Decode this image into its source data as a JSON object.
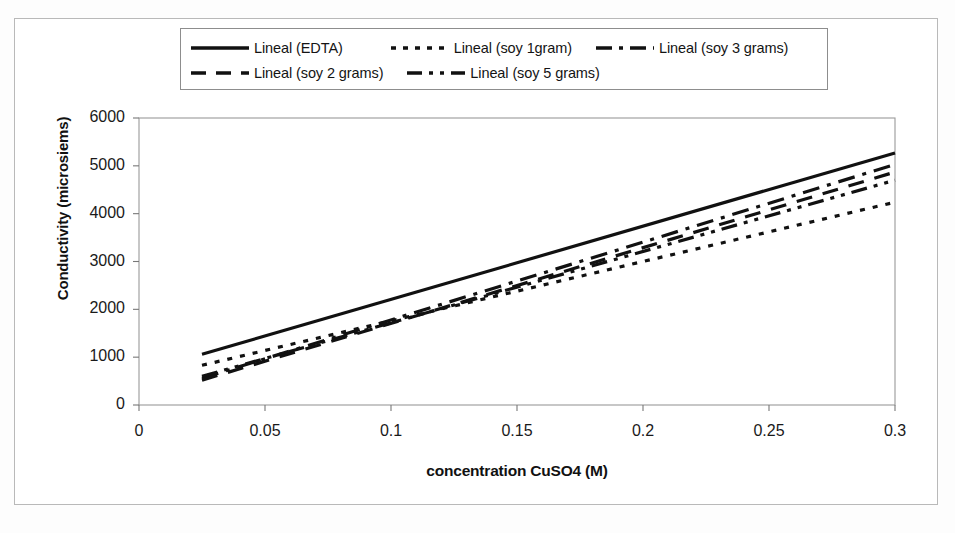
{
  "chart_data": {
    "type": "line",
    "title": "",
    "xlabel": "concentration CuSO4 (M)",
    "ylabel": "Conductivity (microsiems)",
    "xlim": [
      0,
      0.3
    ],
    "ylim": [
      0,
      6000
    ],
    "xticks": [
      "0",
      "0.05",
      "0.1",
      "0.15",
      "0.2",
      "0.25",
      "0.3"
    ],
    "xtick_values": [
      0,
      0.05,
      0.1,
      0.15,
      0.2,
      0.25,
      0.3
    ],
    "yticks": [
      "0",
      "1000",
      "2000",
      "3000",
      "4000",
      "5000",
      "6000"
    ],
    "ytick_values": [
      0,
      1000,
      2000,
      3000,
      4000,
      5000,
      6000
    ],
    "grid": false,
    "legend_position": "top",
    "series": [
      {
        "name": "Lineal (EDTA)",
        "style": "solid",
        "x": [
          0.025,
          0.3
        ],
        "values": [
          1060,
          5270
        ]
      },
      {
        "name": "Lineal (soy 1gram)",
        "style": "dotted",
        "x": [
          0.025,
          0.3
        ],
        "values": [
          830,
          4240
        ]
      },
      {
        "name": "Lineal (soy 3 grams)",
        "style": "dash-dot",
        "x": [
          0.025,
          0.3
        ],
        "values": [
          560,
          5030
        ]
      },
      {
        "name": "Lineal (soy 2 grams)",
        "style": "dashed",
        "x": [
          0.025,
          0.3
        ],
        "values": [
          520,
          4870
        ]
      },
      {
        "name": "Lineal (soy 5 grams)",
        "style": "dash-dot-dot",
        "x": [
          0.025,
          0.3
        ],
        "values": [
          600,
          4700
        ]
      }
    ]
  },
  "legend": {
    "row1": [
      {
        "label": "Lineal (EDTA)",
        "style": "solid"
      },
      {
        "label": "Lineal (soy 1gram)",
        "style": "dotted"
      },
      {
        "label": "Lineal (soy 3 grams)",
        "style": "dash-dot"
      }
    ],
    "row2": [
      {
        "label": "Lineal (soy 2 grams)",
        "style": "dashed"
      },
      {
        "label": "Lineal (soy 5 grams)",
        "style": "dash-dot-dot"
      }
    ]
  },
  "axes": {
    "y_title": "Conductivity (microsiems)",
    "x_title": "concentration CuSO4 (M)"
  },
  "artifact": {
    "bottom_text": ""
  }
}
